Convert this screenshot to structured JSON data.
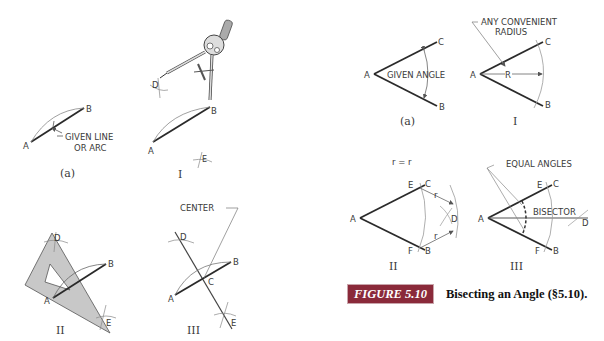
{
  "figure": {
    "number": "FIGURE 5.10",
    "title": "Bisecting an Angle (§5.10).",
    "badge_color": "#8a2a3a"
  },
  "left_panel": {
    "a": {
      "label_A": "A",
      "label_B": "B",
      "note_line1": "GIVEN LINE",
      "note_line2": "OR ARC",
      "step": "(a)"
    },
    "I": {
      "label_A": "A",
      "label_B": "B",
      "label_D": "D",
      "label_E": "E",
      "step": "I"
    },
    "II": {
      "label_A": "A",
      "label_B": "B",
      "label_D": "D",
      "label_E": "E",
      "step": "II"
    },
    "III": {
      "label_A": "A",
      "label_B": "B",
      "label_C": "C",
      "label_D": "D",
      "label_E": "E",
      "note": "CENTER",
      "step": "III"
    }
  },
  "right_panel": {
    "a": {
      "label_A": "A",
      "label_B": "B",
      "label_C": "C",
      "note": "GIVEN ANGLE",
      "step": "(a)"
    },
    "I": {
      "label_A": "A",
      "label_B": "B",
      "label_C": "C",
      "label_R": "R",
      "note_line1": "ANY CONVENIENT",
      "note_line2": "RADIUS",
      "step": "I"
    },
    "II": {
      "label_A": "A",
      "label_B": "B",
      "label_C": "C",
      "label_D": "D",
      "label_E": "E",
      "label_F": "F",
      "label_r1": "r",
      "label_r2": "r",
      "equation": "r = r",
      "step": "II"
    },
    "III": {
      "label_A": "A",
      "label_B": "B",
      "label_C": "C",
      "label_D": "D",
      "label_E": "E",
      "label_F": "F",
      "note": "EQUAL ANGLES",
      "bisector": "BISECTOR",
      "step": "III"
    }
  },
  "colors": {
    "line": "#2a2a2a",
    "thin": "#8a8a8a",
    "triangle_fill": "#c8c8c8"
  }
}
